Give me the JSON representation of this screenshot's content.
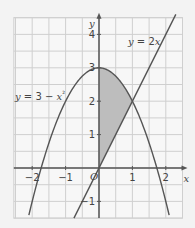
{
  "chart_data": {
    "type": "line",
    "title": "",
    "xlabel": "x",
    "ylabel": "y",
    "origin_label": "O",
    "xlim": [
      -2.55,
      2.5
    ],
    "ylim": [
      -1.5,
      4.5
    ],
    "grid": true,
    "grid_step": 0.5,
    "x_ticks": [
      {
        "value": -2,
        "label": "−2"
      },
      {
        "value": -1,
        "label": "−1"
      },
      {
        "value": 1,
        "label": "1"
      },
      {
        "value": 2,
        "label": "2"
      }
    ],
    "y_ticks": [
      {
        "value": -1,
        "label": "−1"
      },
      {
        "value": 1,
        "label": "1"
      },
      {
        "value": 2,
        "label": "2"
      },
      {
        "value": 3,
        "label": "3"
      },
      {
        "value": 4,
        "label": "4"
      }
    ],
    "series": [
      {
        "name": "y = 3 − x²",
        "label_parts": [
          "y",
          " = 3 − ",
          "x",
          "²"
        ],
        "function": "3 - x^2",
        "x_range": [
          -2.1,
          2.1
        ]
      },
      {
        "name": "y = 2x",
        "label_parts": [
          "y",
          " = 2",
          "x"
        ],
        "function": "2x",
        "x_range": [
          -0.75,
          2.3
        ]
      }
    ],
    "shaded_region": {
      "description": "Region between y = 3 − x² and y = 2x for 0 ≤ x ≤ 1",
      "x_range": [
        0,
        1
      ],
      "upper": "3 - x^2",
      "lower": "2x",
      "color": "#bdbdbd"
    },
    "intersection": {
      "x": 1,
      "y": 2
    }
  },
  "colors": {
    "background": "#f3f3f3",
    "grid": "#cfcfcf",
    "curve": "#555555",
    "axis": "#555555",
    "shade": "#bdbdbd"
  }
}
